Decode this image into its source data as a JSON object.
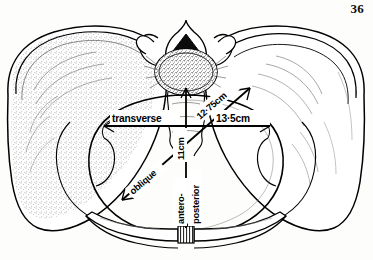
{
  "page": {
    "number": "36",
    "background_color": "#fdfdfb",
    "ink_color": "#000000"
  },
  "figure": {
    "name": "female-pelvic-inlet-diameters",
    "measurements": [
      {
        "id": "transverse",
        "name_label": "transverse",
        "value_label": "13·5cm",
        "orientation": "horizontal"
      },
      {
        "id": "oblique",
        "name_label": "oblique",
        "value_label": "12·75cm",
        "orientation": "diagonal"
      },
      {
        "id": "antero-posterior",
        "name_label_part1": "antero-",
        "name_label_part2": "posterior",
        "value_label": "11cm",
        "orientation": "vertical"
      }
    ],
    "structures": [
      {
        "id": "left-ilium",
        "label": "left iliac wing",
        "shading": "stipple"
      },
      {
        "id": "right-ilium",
        "label": "right iliac wing",
        "shading": "hatch"
      },
      {
        "id": "sacral-promontory",
        "label": "sacral promontory vertebral body",
        "shading": "stipple"
      },
      {
        "id": "spinal-canal",
        "label": "vertebral canal",
        "shading": "solid-black"
      },
      {
        "id": "pubic-symphysis",
        "label": "pubic symphysis",
        "shading": "striated"
      },
      {
        "id": "pelvic-brim",
        "label": "pelvic brim outline",
        "shading": "outline"
      }
    ]
  }
}
